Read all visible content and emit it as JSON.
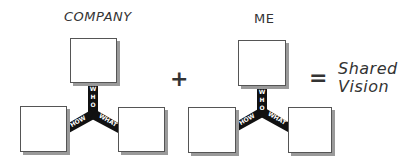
{
  "groups": [
    {
      "title": "COMPANY",
      "connectors": {
        "top": "WHO",
        "left": "HOW",
        "right": "WHAT"
      }
    },
    {
      "title": "ME",
      "connectors": {
        "top": "WHO",
        "left": "HOW",
        "right": "WHAT"
      }
    }
  ],
  "operators": {
    "plus": "+",
    "equals": "="
  },
  "result": {
    "line1": "Shared",
    "line2": "Vision"
  },
  "colors": {
    "connector": "#111111",
    "box_border": "#555555",
    "box_shadow": "#9a9a9a"
  }
}
